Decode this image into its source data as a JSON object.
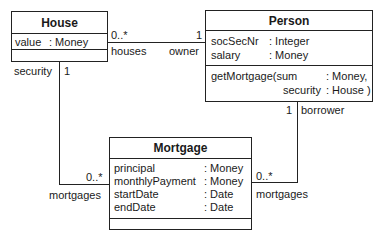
{
  "classes": {
    "house": {
      "name": "House",
      "attributes": [
        {
          "name": "value",
          "type": ": Money"
        }
      ],
      "operations": []
    },
    "person": {
      "name": "Person",
      "attributes": [
        {
          "name": "socSecNr",
          "type": ": Integer"
        },
        {
          "name": "salary",
          "type": ": Money"
        }
      ],
      "operations": [
        {
          "line1_name": "getMortgage(sum",
          "line1_type": ": Money,",
          "line2_name": "security",
          "line2_type": ": House )"
        }
      ]
    },
    "mortgage": {
      "name": "Mortgage",
      "attributes": [
        {
          "name": "principal",
          "type": ": Money"
        },
        {
          "name": "monthlyPayment",
          "type": ": Money"
        },
        {
          "name": "startDate",
          "type": ": Date"
        },
        {
          "name": "endDate",
          "type": ": Date"
        }
      ],
      "operations": []
    }
  },
  "associations": {
    "house_person": {
      "house_end": {
        "multiplicity": "0..*",
        "role": "houses"
      },
      "person_end": {
        "multiplicity": "1",
        "role": "owner"
      }
    },
    "house_mortgage": {
      "house_end": {
        "multiplicity": "1",
        "role": "security"
      },
      "mortgage_end": {
        "multiplicity": "0..*",
        "role": "mortgages"
      }
    },
    "person_mortgage": {
      "person_end": {
        "multiplicity": "1",
        "role": "borrower"
      },
      "mortgage_end": {
        "multiplicity": "0..*",
        "role": "mortgages"
      }
    }
  }
}
